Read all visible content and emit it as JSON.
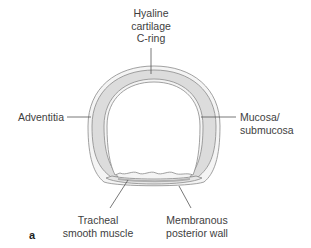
{
  "diagram": {
    "type": "anatomical cross-section",
    "subject": "trachea",
    "panel_label": "a",
    "colors": {
      "cartilage_fill": "#dcdcdc",
      "outline": "#8a8a8a",
      "leader_line": "#555555",
      "text": "#3e3e3e"
    },
    "labels": {
      "top": [
        "Hyaline",
        "cartilage",
        "C-ring"
      ],
      "left": "Adventitia",
      "right": [
        "Mucosa/",
        "submucosa"
      ],
      "bottom_left": [
        "Tracheal",
        "smooth muscle"
      ],
      "bottom_right": [
        "Membranous",
        "posterior wall"
      ]
    }
  }
}
